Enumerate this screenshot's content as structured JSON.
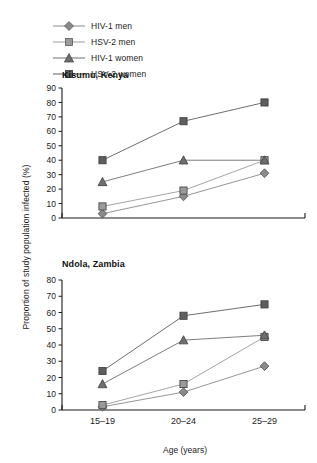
{
  "legend": {
    "items": [
      {
        "label": "HIV-1 men",
        "marker": "diamond-marker",
        "color": "#8a8a8a"
      },
      {
        "label": "HSV-2 men",
        "marker": "light-square-marker",
        "color": "#9a9a9a"
      },
      {
        "label": "HIV-1 women",
        "marker": "triangle-marker",
        "color": "#6e6e6e"
      },
      {
        "label": "HSV-2 women",
        "marker": "dark-square-marker",
        "color": "#5e5e5e"
      }
    ]
  },
  "axis": {
    "ylabel": "Proportion of study population infected (%)",
    "xlabel": "Age (years)"
  },
  "chart_data": [
    {
      "type": "line",
      "title": "Kisumu, Kenya",
      "xlabel": "Age (years)",
      "ylabel": "Proportion of study population infected (%)",
      "categories": [
        "15–19",
        "20–24",
        "25–29"
      ],
      "ylim": [
        0,
        90
      ],
      "yticks": [
        0,
        10,
        20,
        30,
        40,
        50,
        60,
        70,
        80,
        90
      ],
      "grid": false,
      "legend_position": "above-plot",
      "series": [
        {
          "name": "HIV-1 men",
          "marker": "diamond",
          "color": "#8a8a8a",
          "values": [
            3,
            15,
            31
          ]
        },
        {
          "name": "HSV-2 men",
          "marker": "square",
          "color": "#9a9a9a",
          "values": [
            8,
            19,
            40
          ]
        },
        {
          "name": "HIV-1 women",
          "marker": "triangle",
          "color": "#6e6e6e",
          "values": [
            25,
            40,
            40
          ]
        },
        {
          "name": "HSV-2 women",
          "marker": "square",
          "color": "#5e5e5e",
          "values": [
            40,
            67,
            80
          ]
        }
      ]
    },
    {
      "type": "line",
      "title": "Ndola, Zambia",
      "xlabel": "Age (years)",
      "ylabel": "Proportion of study population infected (%)",
      "categories": [
        "15–19",
        "20–24",
        "25–29"
      ],
      "ylim": [
        0,
        80
      ],
      "yticks": [
        0,
        10,
        20,
        30,
        40,
        50,
        60,
        70,
        80
      ],
      "grid": false,
      "legend_position": "above-plot",
      "series": [
        {
          "name": "HIV-1 men",
          "marker": "diamond",
          "color": "#8a8a8a",
          "values": [
            2,
            11,
            27
          ]
        },
        {
          "name": "HSV-2 men",
          "marker": "square",
          "color": "#9a9a9a",
          "values": [
            3,
            16,
            45
          ]
        },
        {
          "name": "HIV-1 women",
          "marker": "triangle",
          "color": "#6e6e6e",
          "values": [
            16,
            43,
            46
          ]
        },
        {
          "name": "HSV-2 women",
          "marker": "square",
          "color": "#5e5e5e",
          "values": [
            24,
            58,
            65
          ]
        }
      ]
    }
  ]
}
